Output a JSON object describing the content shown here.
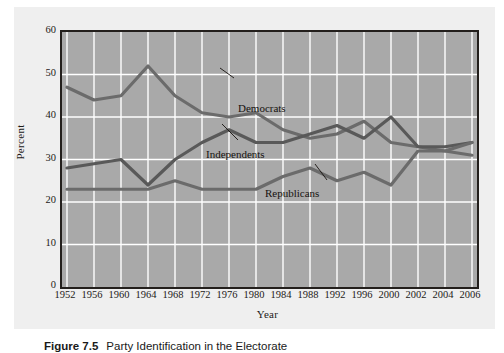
{
  "figure": {
    "caption_number": "Figure 7.5",
    "caption_text": "Party Identification in the Electorate"
  },
  "chart_data": {
    "type": "line",
    "title": "",
    "xlabel": "Year",
    "ylabel": "Percent",
    "grid": true,
    "legend_position": "inline-annotations",
    "xlim": [
      1952,
      2006
    ],
    "ylim": [
      0,
      60
    ],
    "yticks": [
      0,
      10,
      20,
      30,
      40,
      50,
      60
    ],
    "categories": [
      1952,
      1956,
      1960,
      1964,
      1968,
      1972,
      1976,
      1980,
      1984,
      1988,
      1992,
      1996,
      2000,
      2002,
      2004,
      2006
    ],
    "tick_labels": [
      "1952",
      "1956",
      "1960",
      "1964",
      "1968",
      "1972",
      "1976",
      "1980",
      "1984",
      "1988",
      "1992",
      "1996",
      "2000",
      "2002",
      "2004",
      "2006"
    ],
    "series": [
      {
        "name": "Democrats",
        "color": "#6b6b6b",
        "values": [
          47,
          44,
          45,
          52,
          45,
          41,
          40,
          41,
          37,
          35,
          36,
          39,
          34,
          33,
          32,
          31
        ]
      },
      {
        "name": "Independents",
        "color": "#595959",
        "values": [
          28,
          29,
          30,
          24,
          30,
          34,
          37,
          34,
          34,
          36,
          38,
          35,
          40,
          33,
          33,
          34
        ]
      },
      {
        "name": "Republicans",
        "color": "#6b6b6b",
        "values": [
          23,
          23,
          23,
          23,
          25,
          23,
          23,
          23,
          26,
          28,
          25,
          27,
          24,
          32,
          32,
          34
        ]
      }
    ]
  },
  "axis": {
    "y_title": "Percent",
    "x_title": "Year"
  },
  "colors": {
    "plot_background": "#a9a9a9",
    "page_background": "#efefef",
    "gridline": "#ffffff",
    "axis_frame": "#231f1c",
    "series_line": "#636363"
  }
}
